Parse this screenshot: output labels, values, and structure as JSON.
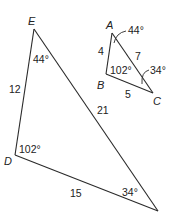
{
  "diagram": {
    "type": "similar-triangles",
    "large_triangle": {
      "vertices": {
        "E": "E",
        "D": "D"
      },
      "unlabeled_vertex": "bottom-right",
      "sides": {
        "ED": "12",
        "E_to_bottom_right": "21",
        "D_to_bottom_right": "15"
      },
      "angles": {
        "E": "44°",
        "D": "102°",
        "bottom_right": "34°"
      }
    },
    "small_triangle": {
      "vertices": {
        "A": "A",
        "B": "B",
        "C": "C"
      },
      "sides": {
        "AB": "4",
        "AC": "7",
        "BC": "5"
      },
      "angles": {
        "A": "44°",
        "B": "102°",
        "C": "34°"
      }
    }
  }
}
